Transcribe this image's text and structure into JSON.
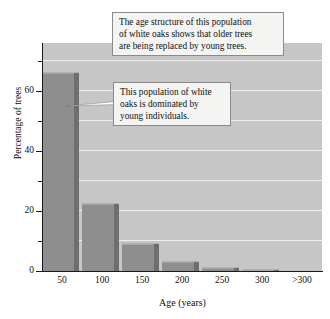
{
  "chart_data": {
    "type": "bar",
    "title": "",
    "subtitle": "",
    "xlabel": "Age (years)",
    "ylabel": "Percentage of trees",
    "categories": [
      "50",
      "100",
      "150",
      "200",
      "250",
      "300",
      ">300"
    ],
    "values": [
      66,
      22.5,
      9,
      3,
      1,
      0.5,
      0
    ],
    "series": [
      {
        "name": "Percentage of trees",
        "values": [
          66,
          22.5,
          9,
          3,
          1,
          0.5,
          0
        ]
      }
    ],
    "ylim": [
      0,
      76
    ],
    "xlim": [
      0,
      7
    ],
    "ytick_major": [
      "0",
      "20",
      "40",
      "60"
    ],
    "ytick_major_values": [
      0,
      20,
      40,
      60
    ],
    "ytick_minor_values": [
      10,
      30,
      50,
      70
    ],
    "gridlines": {
      "enabled": true,
      "orientation": "horizontal",
      "interval": 10,
      "color": "#ededed"
    },
    "legend": {
      "visible": false,
      "position": "none",
      "entries": []
    },
    "annotations": [
      {
        "id": "age-structure",
        "lines": [
          "The age structure of this population",
          "of white oaks shows that older trees",
          "are being replaced by young trees."
        ],
        "has_leader": false
      },
      {
        "id": "young-dominated",
        "lines": [
          "This population of white",
          "oaks is dominated by",
          "young individuals."
        ],
        "has_leader": true,
        "leader_target_category": "50"
      }
    ]
  },
  "colors": {
    "plot_background": "#c6c6c6",
    "bar_face": "#8e8e8e",
    "bar_side": "#6e6e6e",
    "bar_top": "#b0b0b0",
    "gridline": "#ededed",
    "axis": "#1a1a1a",
    "text": "#111111",
    "callout_background": "#f4f4f2",
    "callout_border": "#8a8a8a",
    "figure_background": "#ffffff"
  }
}
